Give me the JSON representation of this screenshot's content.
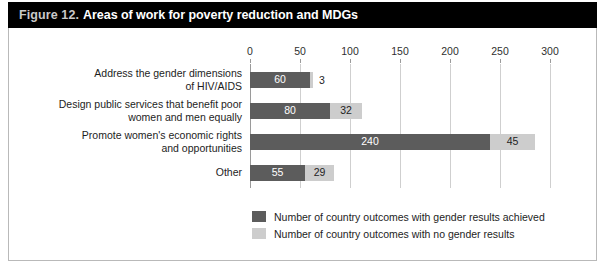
{
  "title": {
    "figure_number": "Figure 12.",
    "text": "Areas of work for poverty reduction and MDGs"
  },
  "colors": {
    "title_bar_background": "#000000",
    "title_number_text": "#c9c9c9",
    "title_text": "#ffffff",
    "series_achieved": "#5c5c5c",
    "series_no_results": "#cdcdcd",
    "gridline": "#cfcfcf",
    "axis": "#9a9a9a",
    "frame_border": "#b9b9b9",
    "plot_background": "#ffffff"
  },
  "chart_data": {
    "type": "bar",
    "orientation": "horizontal",
    "stacked": true,
    "title": "Areas of work for poverty reduction and MDGs",
    "xlabel": "",
    "ylabel": "",
    "xlim": [
      0,
      300
    ],
    "xticks": [
      0,
      50,
      100,
      150,
      200,
      250,
      300
    ],
    "xtick_labels": [
      "0",
      "50",
      "100",
      "150",
      "200",
      "250",
      "300"
    ],
    "grid": true,
    "legend_position": "bottom",
    "categories": [
      "Address the gender dimensions\nof HIV/AIDS",
      "Design public services that benefit poor\nwomen and men equally",
      "Promote women's economic rights\nand opportunities",
      "Other"
    ],
    "series": [
      {
        "name": "Number of country outcomes with gender results achieved",
        "color": "#5c5c5c",
        "values": [
          60,
          80,
          240,
          55
        ]
      },
      {
        "name": "Number of country outcomes with no gender results",
        "color": "#cdcdcd",
        "values": [
          3,
          32,
          45,
          29
        ]
      }
    ],
    "data_labels": {
      "achieved": [
        "60",
        "80",
        "240",
        "55"
      ],
      "no_results": [
        "3",
        "32",
        "45",
        "29"
      ]
    }
  },
  "legend": {
    "items": [
      {
        "label": "Number of country outcomes with gender results achieved",
        "color": "#5c5c5c"
      },
      {
        "label": "Number of country outcomes with no gender results",
        "color": "#cdcdcd"
      }
    ]
  }
}
